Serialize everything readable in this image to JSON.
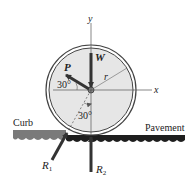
{
  "figure": {
    "labels": {
      "y_axis": "y",
      "x_axis": "x",
      "weight": "W",
      "force_p": "P",
      "radius": "r",
      "angle_p": "30°",
      "angle_r1": "30°",
      "curb": "Curb",
      "pavement": "Pavement",
      "r1": "R",
      "r1_sub": "1",
      "r2": "R",
      "r2_sub": "2"
    },
    "colors": {
      "wheel_fill": "#e6e6e6",
      "rim": "#444444",
      "arrow": "#333333",
      "curb": "#7a7a7a",
      "pavement": "#1e1e1e"
    }
  }
}
